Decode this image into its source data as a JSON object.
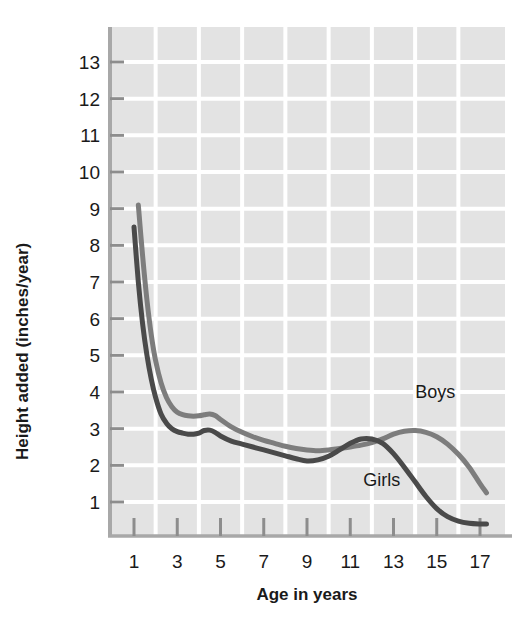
{
  "chart_data": {
    "type": "line",
    "title": "",
    "xlabel": "Age in years",
    "ylabel": "Height added (inches/year)",
    "xlim": [
      0.6,
      17.6
    ],
    "ylim": [
      0,
      13.8
    ],
    "xticks": [
      1,
      3,
      5,
      7,
      9,
      11,
      13,
      15,
      17
    ],
    "yticks": [
      1,
      2,
      3,
      4,
      5,
      6,
      7,
      8,
      9,
      10,
      11,
      12,
      13
    ],
    "xtick_labels": [
      "1",
      "3",
      "5",
      "7",
      "9",
      "11",
      "13",
      "15",
      "17"
    ],
    "ytick_labels": [
      "1",
      "2",
      "3",
      "4",
      "5",
      "6",
      "7",
      "8",
      "9",
      "10",
      "11",
      "12",
      "13"
    ],
    "grid": true,
    "grid_color": "#ffffff",
    "plot_background": "#e3e3e3",
    "legend": "inline-annotations",
    "series": [
      {
        "name": "Boys",
        "color": "#7d7d7d",
        "label_text": "Boys",
        "label_x": 14.0,
        "label_y": 3.85,
        "x": [
          1.2,
          1.4,
          1.6,
          1.8,
          2.0,
          2.25,
          2.5,
          2.75,
          3.0,
          3.25,
          3.5,
          3.75,
          4.0,
          4.25,
          4.5,
          4.75,
          5.0,
          5.5,
          6.0,
          6.5,
          7.0,
          7.5,
          8.0,
          8.5,
          9.0,
          9.5,
          10.0,
          10.5,
          11.0,
          11.5,
          12.0,
          12.5,
          13.0,
          13.5,
          14.0,
          14.5,
          15.0,
          15.5,
          16.0,
          16.5,
          17.0,
          17.3
        ],
        "y": [
          9.1,
          7.7,
          6.5,
          5.55,
          4.85,
          4.25,
          3.85,
          3.6,
          3.45,
          3.38,
          3.35,
          3.34,
          3.35,
          3.38,
          3.4,
          3.36,
          3.25,
          3.05,
          2.9,
          2.78,
          2.68,
          2.6,
          2.52,
          2.46,
          2.42,
          2.4,
          2.42,
          2.46,
          2.5,
          2.55,
          2.62,
          2.72,
          2.85,
          2.93,
          2.95,
          2.9,
          2.78,
          2.58,
          2.3,
          1.95,
          1.5,
          1.25
        ]
      },
      {
        "name": "Girls",
        "color": "#4a4a4a",
        "label_text": "Girls",
        "label_x": 11.6,
        "label_y": 1.45,
        "x": [
          1.0,
          1.2,
          1.4,
          1.6,
          1.8,
          2.0,
          2.25,
          2.5,
          2.75,
          3.0,
          3.25,
          3.5,
          3.75,
          4.0,
          4.25,
          4.5,
          4.75,
          5.0,
          5.5,
          6.0,
          6.5,
          7.0,
          7.5,
          8.0,
          8.5,
          9.0,
          9.5,
          10.0,
          10.5,
          11.0,
          11.5,
          12.0,
          12.5,
          13.0,
          13.5,
          14.0,
          14.5,
          15.0,
          15.5,
          16.0,
          16.5,
          17.0,
          17.3
        ],
        "y": [
          8.5,
          7.0,
          5.85,
          5.0,
          4.35,
          3.85,
          3.4,
          3.15,
          3.0,
          2.92,
          2.88,
          2.85,
          2.85,
          2.88,
          2.95,
          2.96,
          2.9,
          2.8,
          2.66,
          2.58,
          2.5,
          2.42,
          2.34,
          2.26,
          2.18,
          2.12,
          2.15,
          2.25,
          2.42,
          2.6,
          2.72,
          2.72,
          2.6,
          2.32,
          1.95,
          1.55,
          1.15,
          0.82,
          0.6,
          0.48,
          0.42,
          0.4,
          0.4
        ]
      }
    ]
  },
  "axes": {
    "y_axis_title": "Height added (inches/year)",
    "x_axis_title": "Age in years"
  }
}
